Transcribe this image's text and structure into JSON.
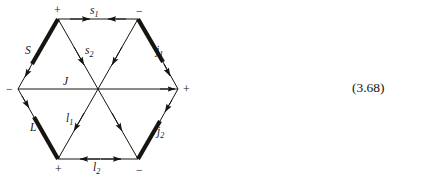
{
  "figure": {
    "name": "hexagon-vector-diagram",
    "equation_number": "(3.68)",
    "stroke_color": "#16140f",
    "vertices": [
      {
        "id": "top-left",
        "x": 58,
        "y": 19,
        "sign": "+"
      },
      {
        "id": "top-right",
        "x": 138,
        "y": 19,
        "sign": "−"
      },
      {
        "id": "right",
        "x": 178,
        "y": 89,
        "sign": "+"
      },
      {
        "id": "bottom-right",
        "x": 138,
        "y": 159,
        "sign": "−"
      },
      {
        "id": "bottom-left",
        "x": 58,
        "y": 159,
        "sign": "+"
      },
      {
        "id": "left",
        "x": 18,
        "y": 89,
        "sign": "−"
      }
    ],
    "edges": [
      {
        "id": "top",
        "label": "s",
        "subscript": "1",
        "weight": "thin",
        "arrows": "inward-pair"
      },
      {
        "id": "upper-right",
        "label": "j",
        "subscript": "1",
        "weight": "thick",
        "arrows": "single-down"
      },
      {
        "id": "lower-right",
        "label": "j",
        "subscript": "2",
        "weight": "thick",
        "arrows": "single-down"
      },
      {
        "id": "bottom",
        "label": "l",
        "subscript": "2",
        "weight": "thin",
        "arrows": "outward-pair"
      },
      {
        "id": "lower-left",
        "label": "L",
        "subscript": "",
        "weight": "thick",
        "arrows": "single-down"
      },
      {
        "id": "upper-left",
        "label": "S",
        "subscript": "",
        "weight": "thick",
        "arrows": "single-down"
      },
      {
        "id": "diagonal-horizontal",
        "label": "J",
        "subscript": "",
        "weight": "thin",
        "arrows": "both-ends"
      },
      {
        "id": "diagonal-upper-left-to-center",
        "label": "s",
        "subscript": "2",
        "weight": "thin",
        "arrows": "toward-center"
      },
      {
        "id": "diagonal-lower-left-to-center",
        "label": "l",
        "subscript": "1",
        "weight": "thin",
        "arrows": "toward-center"
      }
    ],
    "labels": {
      "s1": {
        "text": "s",
        "sub": "1"
      },
      "s2": {
        "text": "s",
        "sub": "2"
      },
      "S": {
        "text": "S",
        "sub": ""
      },
      "J": {
        "text": "J",
        "sub": ""
      },
      "L": {
        "text": "L",
        "sub": ""
      },
      "l1": {
        "text": "l",
        "sub": "1"
      },
      "l2": {
        "text": "l",
        "sub": "2"
      },
      "j1": {
        "text": "j",
        "sub": "1"
      },
      "j2": {
        "text": "j",
        "sub": "2"
      }
    },
    "signs": {
      "top_left": "+",
      "top_right": "−",
      "left": "−",
      "right": "+",
      "bottom_left": "+",
      "bottom_right": "−"
    }
  }
}
